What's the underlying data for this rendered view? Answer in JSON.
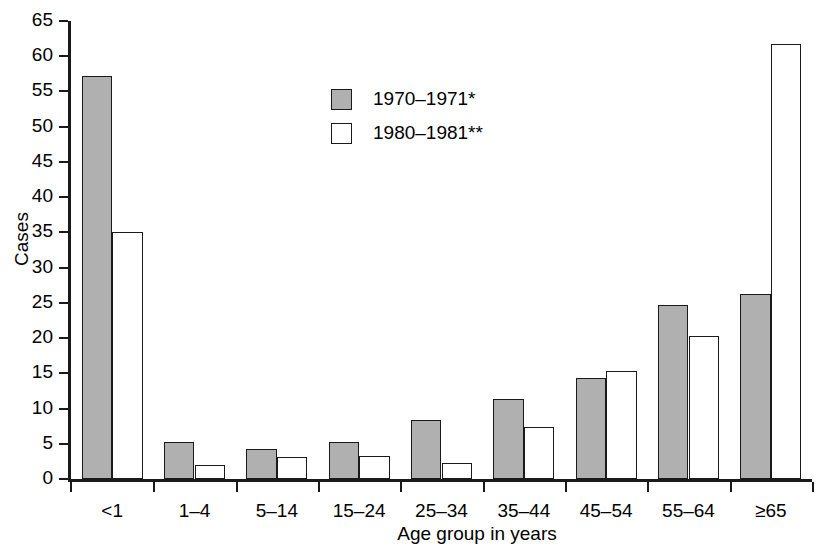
{
  "chart_data": {
    "type": "bar",
    "title": "",
    "xlabel": "Age group in years",
    "ylabel": "Cases",
    "ylim": [
      0,
      65
    ],
    "ytick_step": 5,
    "yticks": [
      0,
      5,
      10,
      15,
      20,
      25,
      30,
      35,
      40,
      45,
      50,
      55,
      60,
      65
    ],
    "grid": false,
    "legend_position": "upper-center-left",
    "categories": [
      "<1",
      "1–4",
      "5–14",
      "15–24",
      "25–34",
      "35–44",
      "45–54",
      "55–64",
      "≥65"
    ],
    "series": [
      {
        "name": "1970–1971*",
        "color": "#b0b0b0",
        "values": [
          57.2,
          5.2,
          4.2,
          5.3,
          8.4,
          11.4,
          14.4,
          24.7,
          26.3
        ]
      },
      {
        "name": "1980–1981**",
        "color": "#ffffff",
        "values": [
          35.0,
          2.0,
          3.1,
          3.3,
          2.3,
          7.4,
          15.4,
          20.3,
          61.8
        ]
      }
    ]
  },
  "legend": {
    "items": [
      {
        "label": "1970–1971*",
        "swatch": "gray"
      },
      {
        "label": "1980–1981**",
        "swatch": "white"
      }
    ]
  },
  "colors": {
    "series_1": "#b0b0b0",
    "series_2": "#ffffff",
    "axis": "#1a1a1a",
    "background": "#ffffff"
  }
}
